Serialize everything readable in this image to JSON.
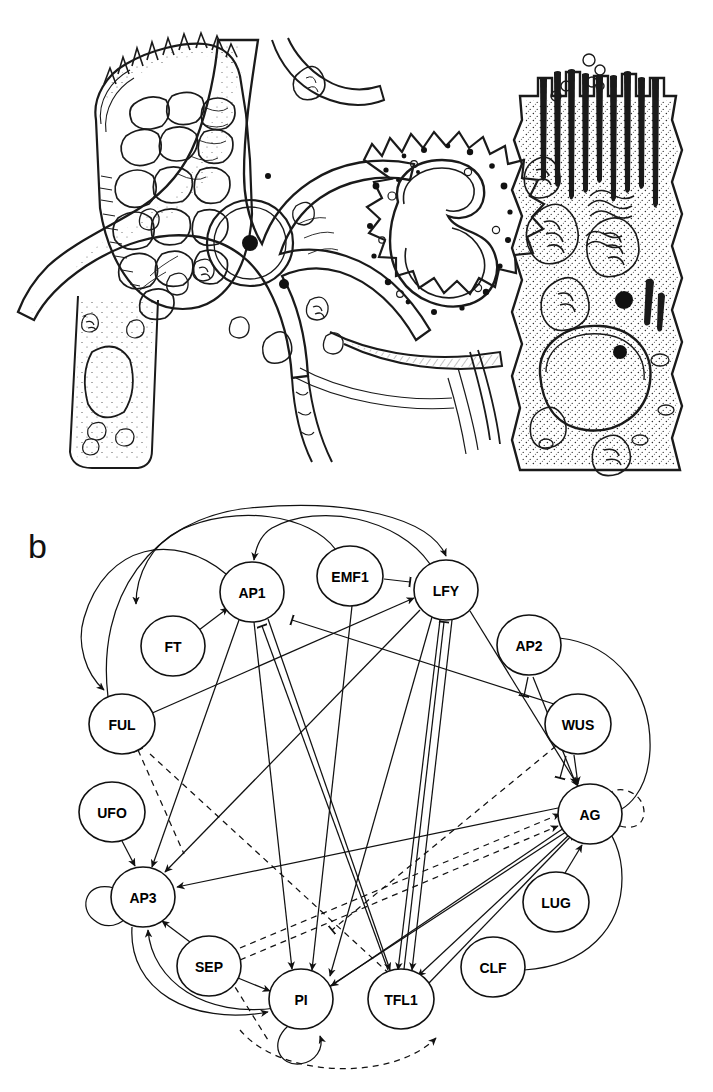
{
  "figure": {
    "panel_label": "b",
    "top_panel": {
      "type": "biological-line-drawing",
      "description": "Ink illustration of tissue cells: a cell packed with large vacuole-like polygonal compartments at left, a branched stellate cell with round nucleus and nucleolus at center, a rounded granulocyte-like cell with lobed nucleus and cytoplasmic granules at upper centre-right, and a tall columnar cell bearing microvilli with mitochondria and a nucleus at right.",
      "elements": [
        "polygonal-vacuole-cell",
        "stellate-cell",
        "lobed-nucleus-granulocyte",
        "columnar-microvilli-cell",
        "mitochondria",
        "nucleus",
        "nucleolus",
        "microvilli"
      ]
    }
  },
  "network": {
    "title": "b",
    "node_radius": 30,
    "nodes": [
      {
        "id": "AP1",
        "label": "AP1",
        "x": 252,
        "y": 114,
        "rx": 32,
        "ry": 30
      },
      {
        "id": "EMF1",
        "label": "EMF1",
        "x": 350,
        "y": 98,
        "rx": 33,
        "ry": 30
      },
      {
        "id": "LFY",
        "label": "LFY",
        "x": 446,
        "y": 112,
        "rx": 32,
        "ry": 30
      },
      {
        "id": "FT",
        "label": "FT",
        "x": 173,
        "y": 168,
        "rx": 32,
        "ry": 30
      },
      {
        "id": "AP2",
        "label": "AP2",
        "x": 529,
        "y": 167,
        "rx": 32,
        "ry": 30
      },
      {
        "id": "FUL",
        "label": "FUL",
        "x": 122,
        "y": 246,
        "rx": 33,
        "ry": 30
      },
      {
        "id": "WUS",
        "label": "WUS",
        "x": 578,
        "y": 246,
        "rx": 33,
        "ry": 30
      },
      {
        "id": "UFO",
        "label": "UFO",
        "x": 112,
        "y": 334,
        "rx": 33,
        "ry": 30
      },
      {
        "id": "AG",
        "label": "AG",
        "x": 590,
        "y": 336,
        "rx": 32,
        "ry": 30
      },
      {
        "id": "AP3",
        "label": "AP3",
        "x": 143,
        "y": 419,
        "rx": 32,
        "ry": 30
      },
      {
        "id": "LUG",
        "label": "LUG",
        "x": 556,
        "y": 424,
        "rx": 33,
        "ry": 30
      },
      {
        "id": "SEP",
        "label": "SEP",
        "x": 209,
        "y": 488,
        "rx": 32,
        "ry": 30
      },
      {
        "id": "CLF",
        "label": "CLF",
        "x": 493,
        "y": 489,
        "rx": 32,
        "ry": 30
      },
      {
        "id": "PI",
        "label": "PI",
        "x": 301,
        "y": 521,
        "rx": 32,
        "ry": 30
      },
      {
        "id": "TFL1",
        "label": "TFL1",
        "x": 401,
        "y": 521,
        "rx": 33,
        "ry": 30
      }
    ],
    "edge_styles": {
      "activation": "solid line with arrowhead",
      "repression": "solid line with blunt T-bar head",
      "inferred": "dashed line"
    },
    "edges": [
      {
        "from": "FT",
        "to": "AP1",
        "kind": "activation",
        "style": "solid"
      },
      {
        "from": "EMF1",
        "to": "LFY",
        "kind": "repression",
        "style": "solid"
      },
      {
        "from": "AP1",
        "to": "FT",
        "kind": "activation",
        "style": "solid",
        "route": "arc"
      },
      {
        "from": "LFY",
        "to": "AP1",
        "kind": "activation",
        "style": "solid",
        "route": "arc"
      },
      {
        "from": "FUL",
        "to": "LFY",
        "kind": "activation",
        "style": "solid"
      },
      {
        "from": "AP1",
        "to": "LFY",
        "kind": "activation",
        "style": "solid",
        "route": "arc"
      },
      {
        "from": "FUL",
        "to": "AP3",
        "kind": "repression",
        "style": "dashed"
      },
      {
        "from": "AP2",
        "to": "AG",
        "kind": "repression",
        "style": "solid"
      },
      {
        "from": "WUS",
        "to": "AG",
        "kind": "activation",
        "style": "solid"
      },
      {
        "from": "LFY",
        "to": "AG",
        "kind": "activation",
        "style": "solid"
      },
      {
        "from": "LFY",
        "to": "AP3",
        "kind": "activation",
        "style": "solid"
      },
      {
        "from": "LFY",
        "to": "PI",
        "kind": "activation",
        "style": "solid"
      },
      {
        "from": "AP1",
        "to": "PI",
        "kind": "activation",
        "style": "solid"
      },
      {
        "from": "AP1",
        "to": "AP3",
        "kind": "activation",
        "style": "solid"
      },
      {
        "from": "UFO",
        "to": "AP3",
        "kind": "activation",
        "style": "solid"
      },
      {
        "from": "AG",
        "to": "AP3",
        "kind": "activation",
        "style": "solid"
      },
      {
        "from": "SEP",
        "to": "AP3",
        "kind": "activation",
        "style": "solid"
      },
      {
        "from": "SEP",
        "to": "PI",
        "kind": "activation",
        "style": "solid"
      },
      {
        "from": "SEP",
        "to": "AG",
        "kind": "activation",
        "style": "dashed"
      },
      {
        "from": "SEP",
        "to": "TFL1",
        "kind": "repression",
        "style": "dashed"
      },
      {
        "from": "PI",
        "to": "PI",
        "kind": "activation",
        "style": "solid",
        "route": "self-loop"
      },
      {
        "from": "AP3",
        "to": "AP3",
        "kind": "activation",
        "style": "solid",
        "route": "self-loop"
      },
      {
        "from": "AG",
        "to": "AG",
        "kind": "activation",
        "style": "dashed",
        "route": "self-loop"
      },
      {
        "from": "TFL1",
        "to": "LFY",
        "kind": "repression",
        "style": "solid"
      },
      {
        "from": "TFL1",
        "to": "AP1",
        "kind": "repression",
        "style": "solid"
      },
      {
        "from": "AG",
        "to": "TFL1",
        "kind": "activation",
        "style": "solid"
      },
      {
        "from": "AG",
        "to": "PI",
        "kind": "activation",
        "style": "solid"
      },
      {
        "from": "LUG",
        "to": "AG",
        "kind": "activation",
        "style": "solid"
      },
      {
        "from": "CLF",
        "to": "AG",
        "kind": "repression",
        "style": "solid",
        "route": "arc"
      },
      {
        "from": "AP2",
        "to": "AG",
        "kind": "repression",
        "style": "solid",
        "route": "arc"
      },
      {
        "from": "WUS",
        "to": "AG",
        "kind": "repression",
        "style": "solid"
      },
      {
        "from": "AP1",
        "to": "TFL1",
        "kind": "repression",
        "style": "solid"
      },
      {
        "from": "LFY",
        "to": "TFL1",
        "kind": "repression",
        "style": "solid"
      },
      {
        "from": "AP3",
        "to": "PI",
        "kind": "activation",
        "style": "solid",
        "route": "arc"
      },
      {
        "from": "PI",
        "to": "AP3",
        "kind": "activation",
        "style": "solid",
        "route": "arc"
      },
      {
        "from": "PI",
        "to": "AG",
        "kind": "activation",
        "style": "dashed",
        "route": "arc"
      },
      {
        "from": "FUL",
        "to": "AG",
        "kind": "activation",
        "style": "solid"
      },
      {
        "from": "TFL1",
        "to": "AG",
        "kind": "activation",
        "style": "solid"
      }
    ]
  }
}
